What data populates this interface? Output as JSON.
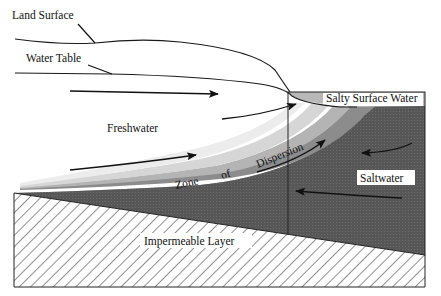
{
  "diagram": {
    "labels": {
      "land_surface": "Land Surface",
      "water_table": "Water Table",
      "freshwater": "Freshwater",
      "salty_surface_water": "Salty Surface Water",
      "zone": "Zone",
      "of": "of",
      "dispersion": "Dispersion",
      "saltwater": "Saltwater",
      "impermeable_layer": "Impermeable Layer"
    },
    "colors": {
      "background": "#ffffff",
      "saltwater": "#5a5a5a",
      "salty_surface": "#b8b8b8",
      "dispersion_outer": "#8c8c8c",
      "dispersion_mid": "#b4b4b4",
      "dispersion_inner": "#d6d6d6",
      "dispersion_edge": "#ececec",
      "line": "#1a1a1a"
    },
    "flow_arrows": [
      {
        "region": "freshwater",
        "direction": "right"
      },
      {
        "region": "freshwater",
        "direction": "up-right"
      },
      {
        "region": "freshwater",
        "direction": "up-right"
      },
      {
        "region": "dispersion",
        "direction": "up-right"
      },
      {
        "region": "saltwater",
        "direction": "left"
      },
      {
        "region": "saltwater",
        "direction": "left"
      }
    ]
  }
}
